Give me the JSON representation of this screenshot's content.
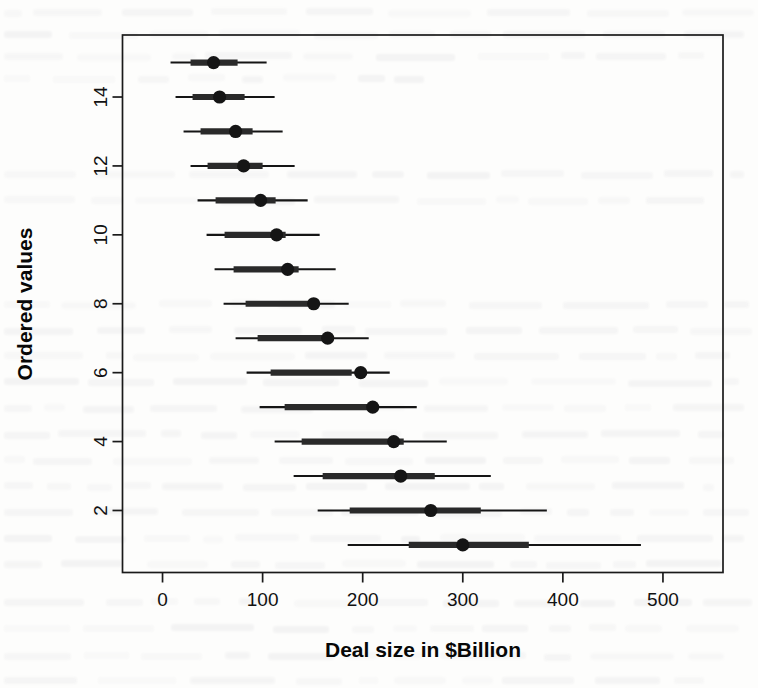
{
  "figure": {
    "name": "caterpillar-plot",
    "background_color": "#ffffff",
    "ink_color": "#151515"
  },
  "chart_data": {
    "type": "scatter",
    "title": "",
    "subtitle": "",
    "xlabel": "Deal size in $Billion",
    "ylabel": "Ordered values",
    "xlim": [
      -40,
      560
    ],
    "ylim": [
      0.2,
      15.8
    ],
    "xticks": [
      0,
      100,
      200,
      300,
      400,
      500
    ],
    "xticklabels": [
      "0",
      "100",
      "200",
      "300",
      "400",
      "500"
    ],
    "yticks": [
      2,
      4,
      6,
      8,
      10,
      12,
      14
    ],
    "yticklabels": [
      "2",
      "4",
      "6",
      "8",
      "10",
      "12",
      "14"
    ],
    "grid": false,
    "legend": null,
    "box": true,
    "marker": "filled-circle",
    "interval_style": "two-level-whisker",
    "series": [
      {
        "name": "Ordered values with credible intervals",
        "y": [
          15,
          14,
          13,
          12,
          11,
          10,
          9,
          8,
          7,
          6,
          5,
          4,
          3,
          2,
          1
        ],
        "values": [
          51,
          57,
          73,
          81,
          98,
          114,
          125,
          151,
          165,
          198,
          210,
          231,
          238,
          268,
          300
        ],
        "inner_low": [
          28,
          30,
          38,
          45,
          53,
          62,
          71,
          83,
          95,
          108,
          122,
          139,
          160,
          187,
          246
        ],
        "inner_high": [
          75,
          82,
          90,
          100,
          113,
          123,
          136,
          152,
          170,
          189,
          213,
          241,
          272,
          318,
          366
        ],
        "outer_low": [
          8,
          13,
          21,
          28,
          35,
          44,
          52,
          61,
          73,
          84,
          97,
          112,
          131,
          155,
          185
        ],
        "outer_high": [
          104,
          112,
          120,
          132,
          145,
          157,
          173,
          186,
          206,
          227,
          254,
          284,
          328,
          384,
          478
        ]
      }
    ]
  }
}
